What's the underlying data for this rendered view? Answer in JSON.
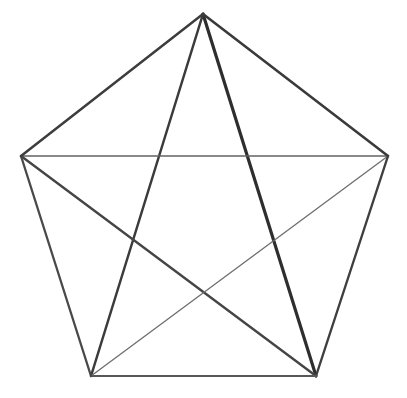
{
  "figure": {
    "background_color": "#ffffff",
    "canvas": {
      "width": 407,
      "height": 398
    },
    "shape_type": "pentagon-with-diagonals",
    "vertex_count": 5,
    "edge_count": 5,
    "diagonal_count": 5,
    "total_line_count": 10
  },
  "vertices": [
    {
      "id": "apex",
      "label": "A",
      "x": 203,
      "y": 14,
      "position_name": "top"
    },
    {
      "id": "right",
      "label": "B",
      "x": 388,
      "y": 156,
      "position_name": "upper-right"
    },
    {
      "id": "bottom-right",
      "label": "C",
      "x": 316,
      "y": 376,
      "position_name": "lower-right"
    },
    {
      "id": "bottom-left",
      "label": "D",
      "x": 91,
      "y": 376,
      "position_name": "lower-left"
    },
    {
      "id": "left",
      "label": "E",
      "x": 21,
      "y": 156,
      "position_name": "upper-left"
    }
  ],
  "edges": [
    {
      "id": "edge-apex-right",
      "from": "apex",
      "to": "right",
      "x1": 203,
      "y1": 14,
      "x2": 388,
      "y2": 156,
      "stroke": "#3a3a3a",
      "width": 2.6
    },
    {
      "id": "edge-right-bottomright",
      "from": "right",
      "to": "bottom-right",
      "x1": 388,
      "y1": 156,
      "x2": 316,
      "y2": 376,
      "stroke": "#3f3f3f",
      "width": 2.4
    },
    {
      "id": "edge-bottomright-bottomleft",
      "from": "bottom-right",
      "to": "bottom-left",
      "x1": 316,
      "y1": 376,
      "x2": 91,
      "y2": 376,
      "stroke": "#585858",
      "width": 1.9
    },
    {
      "id": "edge-bottomleft-left",
      "from": "bottom-left",
      "to": "left",
      "x1": 91,
      "y1": 376,
      "x2": 21,
      "y2": 156,
      "stroke": "#494949",
      "width": 2.3
    },
    {
      "id": "edge-left-apex",
      "from": "left",
      "to": "apex",
      "x1": 21,
      "y1": 156,
      "x2": 203,
      "y2": 14,
      "stroke": "#3d3d3d",
      "width": 2.5
    }
  ],
  "diagonals": [
    {
      "id": "diag-apex-bottomright",
      "from": "apex",
      "to": "bottom-right",
      "x1": 203,
      "y1": 14,
      "x2": 316,
      "y2": 376,
      "stroke": "#2e2e2e",
      "width": 3.2,
      "weight_name": "thick"
    },
    {
      "id": "diag-apex-bottomleft",
      "from": "apex",
      "to": "bottom-left",
      "x1": 203,
      "y1": 14,
      "x2": 91,
      "y2": 376,
      "stroke": "#3b3b3b",
      "width": 2.5,
      "weight_name": "medium"
    },
    {
      "id": "diag-left-right",
      "from": "left",
      "to": "right",
      "x1": 21,
      "y1": 156,
      "x2": 388,
      "y2": 156,
      "stroke": "#636363",
      "width": 1.4,
      "weight_name": "thin"
    },
    {
      "id": "diag-left-bottomright",
      "from": "left",
      "to": "bottom-right",
      "x1": 21,
      "y1": 156,
      "x2": 316,
      "y2": 376,
      "stroke": "#454545",
      "width": 2.4,
      "weight_name": "medium"
    },
    {
      "id": "diag-right-bottomleft",
      "from": "right",
      "to": "bottom-left",
      "x1": 388,
      "y1": 156,
      "x2": 91,
      "y2": 376,
      "stroke": "#6e6e6e",
      "width": 1.3,
      "weight_name": "thin"
    }
  ]
}
